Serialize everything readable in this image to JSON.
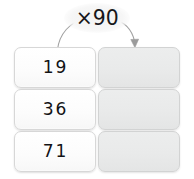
{
  "worksheet": {
    "rule": {
      "label": "×90",
      "operation": "multiply",
      "factor": 90
    },
    "columns": {
      "input_header": "",
      "output_header": ""
    },
    "rows": [
      {
        "input": "19",
        "output": ""
      },
      {
        "input": "36",
        "output": ""
      },
      {
        "input": "71",
        "output": ""
      }
    ],
    "arrow": {
      "from": "input-column",
      "to": "output-column",
      "head": "arrowhead-down"
    },
    "colors": {
      "input_box_fill": "#fcfcfc",
      "output_box_fill": "#e9eaea",
      "box_border": "#d7d7d7",
      "text": "#131316",
      "arrow": "#9b9b9b"
    }
  }
}
